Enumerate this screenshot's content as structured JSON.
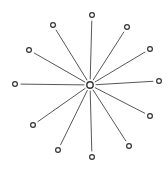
{
  "diagram": {
    "type": "star-network",
    "colors": {
      "background": "#ffffff",
      "stroke": "#333333",
      "spoke": "#3a3a3a"
    },
    "center": {
      "id": "hub",
      "x": 90,
      "y": 85,
      "r": 3.2
    },
    "nodes": [
      {
        "id": "n1",
        "x": 92,
        "y": 15,
        "r": 2.4
      },
      {
        "id": "n2",
        "x": 127,
        "y": 27,
        "r": 2.4
      },
      {
        "id": "n3",
        "x": 150,
        "y": 49,
        "r": 2.4
      },
      {
        "id": "n4",
        "x": 159,
        "y": 81,
        "r": 2.4
      },
      {
        "id": "n5",
        "x": 150,
        "y": 116,
        "r": 2.4
      },
      {
        "id": "n6",
        "x": 129,
        "y": 146,
        "r": 2.4
      },
      {
        "id": "n7",
        "x": 92,
        "y": 157,
        "r": 2.4
      },
      {
        "id": "n8",
        "x": 58,
        "y": 150,
        "r": 2.4
      },
      {
        "id": "n9",
        "x": 33,
        "y": 125,
        "r": 2.4
      },
      {
        "id": "n10",
        "x": 15,
        "y": 84,
        "r": 2.4
      },
      {
        "id": "n11",
        "x": 29,
        "y": 50,
        "r": 2.4
      },
      {
        "id": "n12",
        "x": 53,
        "y": 25,
        "r": 2.4
      }
    ],
    "spoke_inner_gap": 6,
    "spoke_outer_gap": 6
  }
}
